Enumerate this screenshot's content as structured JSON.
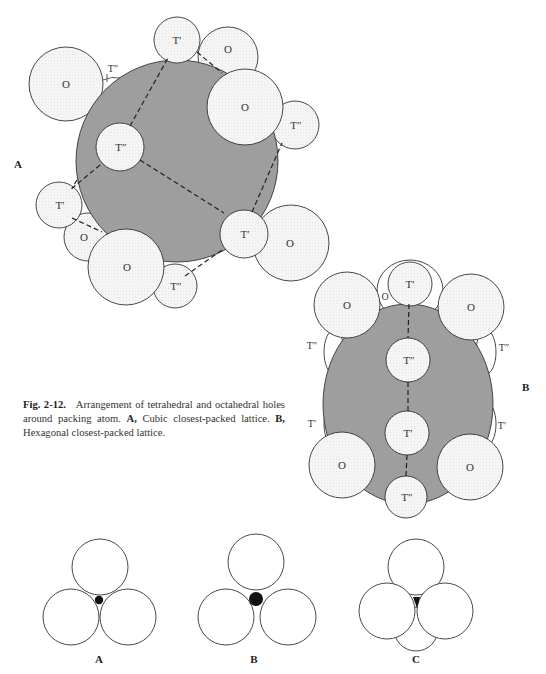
{
  "figure": {
    "number_label": "Fig. 2-12.",
    "caption_text": "Arrangement of tetrahedral and octahedral holes around packing atom.",
    "caption_parts": [
      {
        "bold": "A,",
        "text": "Cubic closest-packed lattice."
      },
      {
        "bold": "B,",
        "text": "Hexagonal closest-packed lattice."
      }
    ]
  },
  "panel_a": {
    "label": "A",
    "central_atom_color": "#9e9e9e",
    "hole_color": "#f4f4f4",
    "holes": [
      {
        "type": "O",
        "label": "O"
      },
      {
        "type": "T'",
        "label": "T′"
      },
      {
        "type": "O",
        "label": "O"
      },
      {
        "type": "O",
        "label": "O"
      },
      {
        "type": "T''",
        "label": "T″"
      },
      {
        "type": "T''",
        "label": "T″"
      },
      {
        "type": "T'",
        "label": "T′"
      },
      {
        "type": "O",
        "label": "O"
      },
      {
        "type": "O",
        "label": "O"
      },
      {
        "type": "T''",
        "label": "T″"
      },
      {
        "type": "T'",
        "label": "T′"
      },
      {
        "type": "O",
        "label": "O"
      },
      {
        "type": "T''",
        "label": "T″"
      }
    ]
  },
  "panel_b": {
    "label": "B",
    "holes": [
      {
        "type": "O",
        "label": "O"
      },
      {
        "type": "O",
        "label": "O"
      },
      {
        "type": "T'",
        "label": "T′"
      },
      {
        "type": "O",
        "label": "O"
      },
      {
        "type": "T''",
        "label": "T″"
      },
      {
        "type": "T''",
        "label": "T″"
      },
      {
        "type": "T''",
        "label": "T″"
      },
      {
        "type": "T'",
        "label": "T′"
      },
      {
        "type": "T'",
        "label": "T′"
      },
      {
        "type": "T'",
        "label": "T′"
      },
      {
        "type": "O",
        "label": "O"
      },
      {
        "type": "O",
        "label": "O"
      },
      {
        "type": "T''",
        "label": "T″"
      }
    ]
  },
  "bottom_panels": [
    {
      "label": "A",
      "description": "three spheres with small void"
    },
    {
      "label": "B",
      "description": "three spheres with larger void"
    },
    {
      "label": "C",
      "description": "four spheres with triangular void"
    }
  ]
}
